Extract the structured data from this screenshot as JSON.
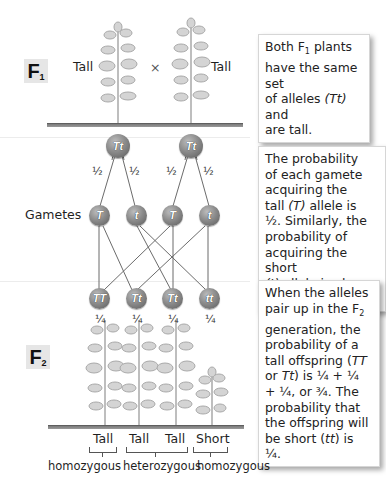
{
  "f1": {
    "badge_letter": "F",
    "badge_sub": "1",
    "left_label": "Tall",
    "cross_symbol": "×",
    "right_label": "Tall",
    "parents": [
      {
        "genotype": "Tt"
      },
      {
        "genotype": "Tt"
      }
    ],
    "note": {
      "line1_a": "Both F",
      "line1_sub": "1",
      "line1_b": " plants",
      "line2": "have the same set",
      "line3_a": "of alleles ",
      "line3_i": "(Tt)",
      "line3_b": " and",
      "line4": "are tall."
    }
  },
  "gametes": {
    "label": "Gametes",
    "probabilities": [
      "½",
      "½",
      "½",
      "½"
    ],
    "alleles": [
      {
        "allele": "T"
      },
      {
        "allele": "t"
      },
      {
        "allele": "T"
      },
      {
        "allele": "t"
      }
    ],
    "note": {
      "l1": "The probability",
      "l2": "of each gamete",
      "l3": "acquiring the",
      "l4_a": "tall ",
      "l4_i": "(T)",
      "l4_b": " allele is",
      "l5": "½. Similarly, the",
      "l6": "probability of",
      "l7": "acquiring the short",
      "l8_i": "(t)",
      "l8_b": " allele is also ½."
    }
  },
  "f2": {
    "badge_letter": "F",
    "badge_sub": "2",
    "offspring": [
      {
        "genotype": "TT",
        "probability": "¼",
        "phenotype": "Tall"
      },
      {
        "genotype": "Tt",
        "probability": "¼",
        "phenotype": "Tall"
      },
      {
        "genotype": "Tt",
        "probability": "¼",
        "phenotype": "Tall"
      },
      {
        "genotype": "tt",
        "probability": "¼",
        "phenotype": "Short"
      }
    ],
    "groups": [
      "homozygous",
      "heterozygous",
      "homozygous"
    ],
    "note": {
      "l1": "When the alleles",
      "l2_a": "pair up in the F",
      "l2_sub": "2",
      "l3": "generation, the",
      "l4": "probability of a",
      "l5_a": "tall offspring (",
      "l5_i": "TT",
      "l6_a": "or ",
      "l6_i": "Tt",
      "l6_b": ") is ¼ + ¼",
      "l7": "+ ¼, or ¾. The",
      "l8": "probability that",
      "l9": "the offspring will",
      "l10_a": "be short (",
      "l10_i": "tt",
      "l10_b": ") is ¼."
    }
  },
  "colors": {
    "ball": "#8c8c8c",
    "ground": "#7a7a7a",
    "badge_bg": "#e6e6e6",
    "plant": "#b5b5b5"
  }
}
